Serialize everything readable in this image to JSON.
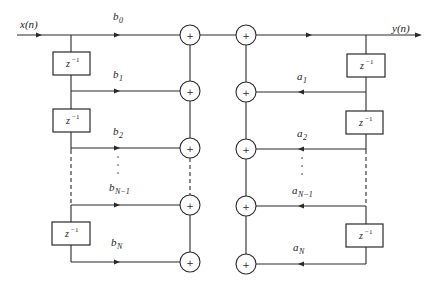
{
  "diagram": {
    "type": "signal-flow-graph",
    "input_label": "x(n)",
    "output_label": "y(n)",
    "delay_label": "z",
    "delay_exponent": "−1",
    "adder_symbol": "+",
    "feedforward": {
      "coefficients": [
        {
          "base": "b",
          "sub": "0"
        },
        {
          "base": "b",
          "sub": "1"
        },
        {
          "base": "b",
          "sub": "2"
        },
        {
          "base": "b",
          "sub": "N−1"
        },
        {
          "base": "b",
          "sub": "N"
        }
      ]
    },
    "feedback": {
      "coefficients": [
        {
          "base": "a",
          "sub": "1"
        },
        {
          "base": "a",
          "sub": "2"
        },
        {
          "base": "a",
          "sub": "N−1"
        },
        {
          "base": "a",
          "sub": "N"
        }
      ]
    },
    "ellipsis": "⋮"
  }
}
